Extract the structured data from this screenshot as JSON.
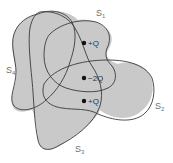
{
  "diagram": {
    "type": "gauss-law-surfaces",
    "fill_color": "#c9c9c9",
    "stroke_color": "#3a3a3a",
    "surfaces": [
      {
        "id": "S1",
        "label": "S",
        "subscript": "1"
      },
      {
        "id": "S2",
        "label": "S",
        "subscript": "2"
      },
      {
        "id": "S3",
        "label": "S",
        "subscript": "3"
      },
      {
        "id": "S4",
        "label": "S",
        "subscript": "4"
      }
    ],
    "charges": [
      {
        "label": "+Q"
      },
      {
        "label": "−2Q"
      },
      {
        "label": "+Q"
      }
    ]
  }
}
